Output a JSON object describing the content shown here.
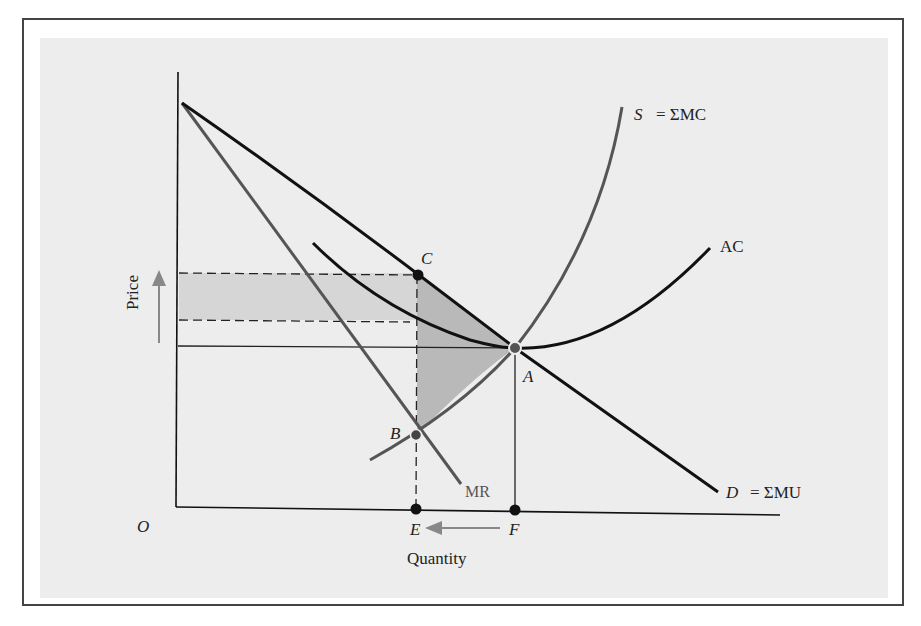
{
  "diagram": {
    "axes": {
      "origin_label": "O",
      "x_axis_label": "Quantity",
      "y_axis_label": "Price",
      "y_arrow_direction": "up",
      "x_arrow_direction": "left (F to E)"
    },
    "curves": [
      {
        "id": "S",
        "label_italic": "S",
        "label_rest": "= ΣMC",
        "color": "#555555"
      },
      {
        "id": "AC",
        "label_italic": "",
        "label_rest": "AC",
        "color": "#111111"
      },
      {
        "id": "D",
        "label_italic": "D",
        "label_rest": "= ΣMU",
        "color": "#111111"
      },
      {
        "id": "MR",
        "label_italic": "",
        "label_rest": "MR",
        "color": "#555555"
      }
    ],
    "points": {
      "A": "A",
      "B": "B",
      "C": "C",
      "E": "E",
      "F": "F"
    },
    "shaded_regions": [
      {
        "name": "monopoly-profit-rectangle",
        "color": "#d3d3d3"
      },
      {
        "name": "deadweight-loss-triangle",
        "color": "#b8b8b8"
      }
    ],
    "colors": {
      "background": "#ededed",
      "frame": "#444444",
      "arrow": "#888888"
    }
  }
}
